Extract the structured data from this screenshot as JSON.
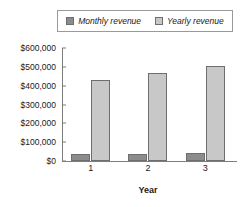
{
  "chart_data": {
    "type": "bar",
    "title": "",
    "subtitle": "",
    "xlabel": "Year",
    "ylabel": "",
    "categories": [
      "1",
      "2",
      "3"
    ],
    "series": [
      {
        "name": "Monthly revenue",
        "color": "#8c8c8c",
        "values": [
          35000,
          38000,
          42000
        ]
      },
      {
        "name": "Yearly revenue",
        "color": "#c8c8c8",
        "values": [
          430000,
          465000,
          505000
        ]
      }
    ],
    "ylim": [
      0,
      600000
    ],
    "ytick_values": [
      0,
      100000,
      200000,
      300000,
      400000,
      500000,
      600000
    ],
    "ytick_labels": [
      "$0",
      "$100,000",
      "$200,000",
      "$300,000",
      "$400,000",
      "$500,000",
      "$600,000"
    ],
    "grid": false,
    "legend_position": "top",
    "legend_border_color": "#9a9a9a",
    "axis_color": "#7d7d7d",
    "bar_border_color": "#6e6e6e",
    "background": "#ffffff"
  },
  "legend": {
    "entries": [
      {
        "label": "Monthly revenue",
        "color": "#8c8c8c"
      },
      {
        "label": "Yearly revenue",
        "color": "#c8c8c8"
      }
    ]
  }
}
